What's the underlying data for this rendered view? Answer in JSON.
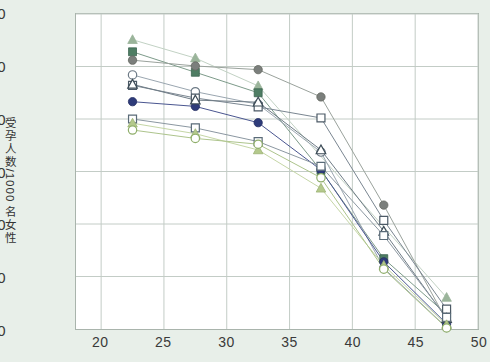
{
  "axes": {
    "ylabel": "受孕人数/1000 名女性",
    "yticks": [
      0,
      100,
      200,
      300,
      400,
      500,
      600
    ],
    "xticks": [
      20,
      25,
      30,
      35,
      40,
      45,
      50
    ],
    "ylim": [
      0,
      600
    ],
    "xlim": [
      18,
      50
    ]
  },
  "chart_data": {
    "type": "line",
    "title": "",
    "subtitle": "",
    "xlabel": "",
    "ylabel": "受孕人数/1000 名女性",
    "xlim": [
      18,
      50
    ],
    "ylim": [
      0,
      600
    ],
    "grid": true,
    "legend_position": "none",
    "x": [
      22.5,
      27.5,
      32.5,
      37.5,
      42.5,
      47.5
    ],
    "xtick_labels": [
      "20",
      "25",
      "30",
      "35",
      "40",
      "45",
      "50"
    ],
    "ytick_labels": [
      "0",
      "100",
      "200",
      "300",
      "400",
      "500",
      "600"
    ],
    "series": [
      {
        "name": "series-1",
        "marker": "triangle-filled",
        "fill": "#9ab49a",
        "stroke": "#9ab49a",
        "line": "#c2d2c4",
        "values": [
          551,
          516,
          463,
          null,
          null,
          60
        ]
      },
      {
        "name": "series-2",
        "marker": "square-filled",
        "fill": "#4e7d63",
        "stroke": "#3c6450",
        "line": "#7d9b8a",
        "values": [
          528,
          489,
          450,
          302,
          134,
          28
        ]
      },
      {
        "name": "series-3",
        "marker": "circle-filled",
        "fill": "#7b7f7c",
        "stroke": "#63675f",
        "line": "#9aa29c",
        "values": [
          512,
          501,
          494,
          442,
          236,
          16
        ]
      },
      {
        "name": "series-4",
        "marker": "circle-open",
        "fill": "#ffffff",
        "stroke": "#6d7a86",
        "line": "#9aa6b0",
        "values": [
          484,
          452,
          428,
          337,
          116,
          3
        ]
      },
      {
        "name": "series-5",
        "marker": "square-open",
        "fill": "#ffffff",
        "stroke": "#4c5a66",
        "line": "#7a8691",
        "values": [
          464,
          440,
          423,
          402,
          207,
          38
        ]
      },
      {
        "name": "series-6",
        "marker": "circle-filled",
        "fill": "#2e3b7a",
        "stroke": "#242f63",
        "line": "#4a5690",
        "values": [
          433,
          424,
          393,
          303,
          128,
          10
        ]
      },
      {
        "name": "series-7",
        "marker": "triangle-open",
        "fill": "#ffffff",
        "stroke": "#3b4a55",
        "line": "#6f7c86",
        "values": [
          466,
          436,
          432,
          341,
          186,
          20
        ]
      },
      {
        "name": "series-8",
        "marker": "square-open",
        "fill": "#ffffff",
        "stroke": "#5a6b78",
        "line": "#8b97a1",
        "values": [
          400,
          383,
          357,
          310,
          178,
          22
        ]
      },
      {
        "name": "series-9",
        "marker": "triangle-filled",
        "fill": "#b4c98c",
        "stroke": "#9cb375",
        "line": "#c5d6a6",
        "values": [
          392,
          372,
          341,
          268,
          121,
          8
        ]
      },
      {
        "name": "series-10",
        "marker": "circle-open",
        "fill": "#ffffff",
        "stroke": "#8fae6a",
        "line": "#adc48c",
        "values": [
          379,
          363,
          352,
          288,
          114,
          2
        ]
      }
    ]
  }
}
